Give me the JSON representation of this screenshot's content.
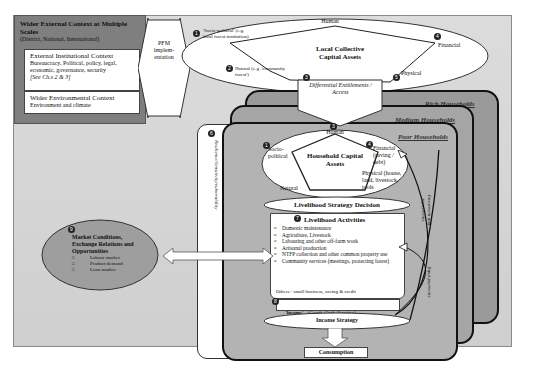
{
  "external_context": {
    "title": "Wider External Context at Multiple Scales",
    "scales": "(District, National, International)",
    "institutional": {
      "title": "External Institutional Context",
      "body": "Bureaucracy, Political, policy, legal, economic, governance, security",
      "ref": "[See Ch.s 2 & 3]"
    },
    "environmental": {
      "title": "Wider Environmental Context",
      "body": "Environment and climate"
    }
  },
  "pfm_arrow": {
    "label": "PFM implem-entation"
  },
  "local_assets": {
    "title": "Local Collective Capital Assets",
    "nodes": {
      "human": "Human",
      "socio_political": "'Socio-political' (e.g. local forest institution)",
      "natural": "Natural (e.g. 'community forest')",
      "financial": "Financial",
      "physical": "Physical"
    },
    "numbers": {
      "socio": "1",
      "natural": "2",
      "financial": "4",
      "physical": "5",
      "entitle": "3"
    }
  },
  "entitlements": {
    "label": "Differential Entitlements / Access"
  },
  "households": {
    "rich": "Rich Households",
    "medium": "Medium Households",
    "poor": "Poor Households"
  },
  "resilience": {
    "label": "Resilience/Sensitivity/vulnerability",
    "number": "6"
  },
  "household_assets": {
    "title": "Household Capital Assets",
    "nodes": {
      "human": "Human",
      "socio_political": "Socio-political",
      "financial": "Financial (saving / debt)",
      "physical": "Physical (house, land, livestock, tools",
      "natural": "Natural"
    },
    "numbers": {
      "socio": "1",
      "financial": "4",
      "human": "3"
    }
  },
  "strategy_decision": {
    "label": "Livelihood Strategy Decision"
  },
  "activities": {
    "title": "Livelihood Activities",
    "number": "7",
    "items": [
      "Domestic maintenance",
      "Agriculture, Livestock",
      "Labouring and other off-farm work",
      "Artisanal production",
      "NTFP collection and other common property use",
      "Community services (meetings, protecting forest)"
    ],
    "others": "Others - small business, saving & credit"
  },
  "income": {
    "label": "'Income'",
    "detail": "(Goods, Cash, Services)",
    "number": "8"
  },
  "income_strategy": {
    "label": "Income Strategy"
  },
  "consumption": {
    "label": "Consumption"
  },
  "feedback": {
    "investment": "Investment and repayments",
    "input": "Input payments"
  },
  "market": {
    "number": "9",
    "title": "Market Conditions, Exchange Relations and Opportunities",
    "items": [
      "Labour market",
      "Product demand",
      "Loan market"
    ]
  }
}
